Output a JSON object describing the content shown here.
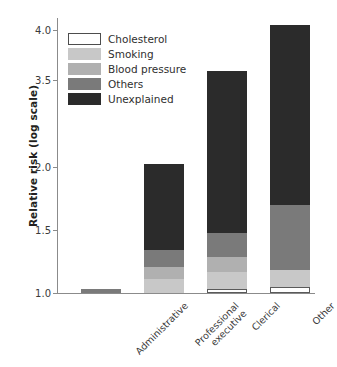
{
  "chart_data": {
    "type": "bar",
    "subtype": "stacked-bar",
    "title": "",
    "xlabel": "",
    "ylabel": "Relative risk (log scale)",
    "ylim": [
      1.0,
      4.05
    ],
    "yscale": "log",
    "grid": false,
    "legend_position": "top-left",
    "categories": [
      "Administrative",
      "Professional\nexecutive",
      "Clerical",
      "Other"
    ],
    "category_labels": [
      {
        "line1": "Administrative",
        "line2": ""
      },
      {
        "line1": "Professional",
        "line2": "executive"
      },
      {
        "line1": "Clerical",
        "line2": ""
      },
      {
        "line1": "Other",
        "line2": ""
      }
    ],
    "ytick_labels": [
      "4.0",
      "3.5",
      "2.0",
      "1.5",
      "1.0"
    ],
    "ytick_values": [
      4.0,
      3.5,
      2.0,
      1.5,
      1.0
    ],
    "series": [
      {
        "name": "Cholesterol",
        "color": "#ffffff",
        "values": [
          0.0,
          0.0,
          0.03,
          0.05
        ]
      },
      {
        "name": "Smoking",
        "color": "#c8c8c8",
        "values": [
          0.0,
          0.11,
          0.14,
          0.13
        ]
      },
      {
        "name": "Blood pressure",
        "color": "#b0b0b0",
        "values": [
          0.0,
          0.1,
          0.12,
          0.0
        ]
      },
      {
        "name": "Others",
        "color": "#7a7a7a",
        "values": [
          0.03,
          0.13,
          0.19,
          0.52
        ]
      },
      {
        "name": "Unexplained",
        "color": "#2b2b2b",
        "values": [
          0.0,
          0.72,
          2.11,
          2.35
        ]
      }
    ],
    "cumulative_tops": [
      {
        "category": "Administrative",
        "cholesterol": 1.0,
        "smoking": 1.0,
        "blood_pressure": 1.0,
        "others": 1.03,
        "unexplained": 1.03
      },
      {
        "category": "Professional executive",
        "cholesterol": 1.0,
        "smoking": 1.11,
        "blood_pressure": 1.21,
        "others": 1.34,
        "unexplained": 2.06
      },
      {
        "category": "Clerical",
        "cholesterol": 1.03,
        "smoking": 1.17,
        "blood_pressure": 1.29,
        "others": 1.48,
        "unexplained": 3.59
      },
      {
        "category": "Other",
        "cholesterol": 1.05,
        "smoking": 1.18,
        "blood_pressure": 1.18,
        "others": 1.7,
        "unexplained": 4.05
      }
    ],
    "bar_totals": [
      1.03,
      2.06,
      3.59,
      4.05
    ]
  },
  "legend": {
    "items": [
      {
        "label": "Cholesterol",
        "color": "#ffffff"
      },
      {
        "label": "Smoking",
        "color": "#c8c8c8"
      },
      {
        "label": "Blood pressure",
        "color": "#b0b0b0"
      },
      {
        "label": "Others",
        "color": "#7a7a7a"
      },
      {
        "label": "Unexplained",
        "color": "#2b2b2b"
      }
    ]
  },
  "axis": {
    "y_title": "Relative risk (log scale)"
  }
}
